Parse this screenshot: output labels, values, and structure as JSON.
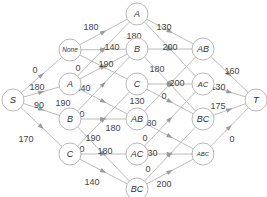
{
  "diagram": {
    "type": "state-lattice network (source to sink)",
    "nodes": [
      {
        "id": "S",
        "label": "S",
        "x": 13,
        "y": 100,
        "size": 9.5,
        "italic": false
      },
      {
        "id": "None",
        "label": "None",
        "x": 70,
        "y": 50,
        "size": 6.5,
        "italic": true
      },
      {
        "id": "A1",
        "label": "A",
        "x": 70,
        "y": 84,
        "size": 9,
        "italic": true
      },
      {
        "id": "B1",
        "label": "B",
        "x": 70,
        "y": 119,
        "size": 9,
        "italic": true
      },
      {
        "id": "C1",
        "label": "C",
        "x": 70,
        "y": 154,
        "size": 9,
        "italic": true
      },
      {
        "id": "A2",
        "label": "A",
        "x": 137,
        "y": 14,
        "size": 9,
        "italic": true
      },
      {
        "id": "B2",
        "label": "B",
        "x": 137,
        "y": 49,
        "size": 9,
        "italic": true
      },
      {
        "id": "C2",
        "label": "C",
        "x": 137,
        "y": 84,
        "size": 9,
        "italic": true
      },
      {
        "id": "AB2",
        "label": "AB",
        "x": 137,
        "y": 119,
        "size": 9,
        "italic": true
      },
      {
        "id": "AC2",
        "label": "AC",
        "x": 137,
        "y": 154,
        "size": 9,
        "italic": true
      },
      {
        "id": "BC2",
        "label": "BC",
        "x": 137,
        "y": 189,
        "size": 9,
        "italic": true
      },
      {
        "id": "AB3",
        "label": "AB",
        "x": 203,
        "y": 49,
        "size": 9,
        "italic": true
      },
      {
        "id": "AC3",
        "label": "AC",
        "x": 203,
        "y": 84,
        "size": 7.5,
        "italic": true
      },
      {
        "id": "BC3",
        "label": "BC",
        "x": 203,
        "y": 119,
        "size": 9,
        "italic": true
      },
      {
        "id": "ABC3",
        "label": "ABC",
        "x": 203,
        "y": 154,
        "size": 6,
        "italic": true
      },
      {
        "id": "T",
        "label": "T",
        "x": 256,
        "y": 100,
        "size": 9.5,
        "italic": true
      }
    ],
    "edges": [
      {
        "from": "S",
        "to": "None",
        "label": "0",
        "lx": 35,
        "ly": 70
      },
      {
        "from": "S",
        "to": "A1",
        "label": "180",
        "lx": 37,
        "ly": 87
      },
      {
        "from": "S",
        "to": "B1",
        "label": "90",
        "lx": 39,
        "ly": 105
      },
      {
        "from": "S",
        "to": "C1",
        "label": "170",
        "lx": 26,
        "ly": 139
      },
      {
        "from": "None",
        "to": "A2",
        "label": "180",
        "lx": 91,
        "ly": 27
      },
      {
        "from": "None",
        "to": "B2",
        "label": "140",
        "lx": 112,
        "ly": 47
      },
      {
        "from": "None",
        "to": "C2",
        "label": "190",
        "lx": 106,
        "ly": 64
      },
      {
        "from": "A1",
        "to": "A2",
        "label": "0",
        "lx": 78,
        "ly": 68
      },
      {
        "from": "A1",
        "to": "B2",
        "label": "140",
        "lx": 83,
        "ly": 88
      },
      {
        "from": "A1",
        "to": "AB2",
        "label": "190",
        "lx": 63,
        "ly": 103
      },
      {
        "from": "B1",
        "to": "B2",
        "label": "0",
        "lx": 82,
        "ly": 114
      },
      {
        "from": "B1",
        "to": "AB2",
        "label": "180",
        "lx": 113,
        "ly": 128
      },
      {
        "from": "B1",
        "to": "BC2",
        "label": "190",
        "lx": 93,
        "ly": 138
      },
      {
        "from": "C1",
        "to": "C2",
        "label": "0",
        "lx": 82,
        "ly": 149
      },
      {
        "from": "C1",
        "to": "AC2",
        "label": "180",
        "lx": 105,
        "ly": 151
      },
      {
        "from": "C1",
        "to": "BC2",
        "label": "140",
        "lx": 92,
        "ly": 182
      },
      {
        "from": "A2",
        "to": "AB3",
        "label": "130",
        "lx": 164,
        "ly": 27
      },
      {
        "from": "A2",
        "to": "AC3",
        "label": "180",
        "lx": 134,
        "ly": 36
      },
      {
        "from": "B2",
        "to": "AB3",
        "label": "200",
        "lx": 170,
        "ly": 47
      },
      {
        "from": "B2",
        "to": "BC3",
        "label": "180",
        "lx": 157,
        "ly": 69
      },
      {
        "from": "C2",
        "to": "AC3",
        "label": "200",
        "lx": 177,
        "ly": 83
      },
      {
        "from": "C2",
        "to": "BC3",
        "label": "130",
        "lx": 137,
        "ly": 101
      },
      {
        "from": "AB2",
        "to": "AB3",
        "label": "0",
        "lx": 164,
        "ly": 96
      },
      {
        "from": "AB2",
        "to": "ABC3",
        "label": "180",
        "lx": 149,
        "ly": 123
      },
      {
        "from": "AC2",
        "to": "AC3",
        "label": "0",
        "lx": 145,
        "ly": 138
      },
      {
        "from": "AC2",
        "to": "ABC3",
        "label": "130",
        "lx": 150,
        "ly": 153
      },
      {
        "from": "BC2",
        "to": "BC3",
        "label": "0",
        "lx": 148,
        "ly": 169
      },
      {
        "from": "BC2",
        "to": "ABC3",
        "label": "200",
        "lx": 164,
        "ly": 184
      },
      {
        "from": "AB3",
        "to": "T",
        "label": "160",
        "lx": 232,
        "ly": 71
      },
      {
        "from": "AC3",
        "to": "T",
        "label": "130",
        "lx": 218,
        "ly": 87
      },
      {
        "from": "BC3",
        "to": "T",
        "label": "175",
        "lx": 218,
        "ly": 106
      },
      {
        "from": "ABC3",
        "to": "T",
        "label": "0",
        "lx": 232,
        "ly": 139
      }
    ]
  }
}
